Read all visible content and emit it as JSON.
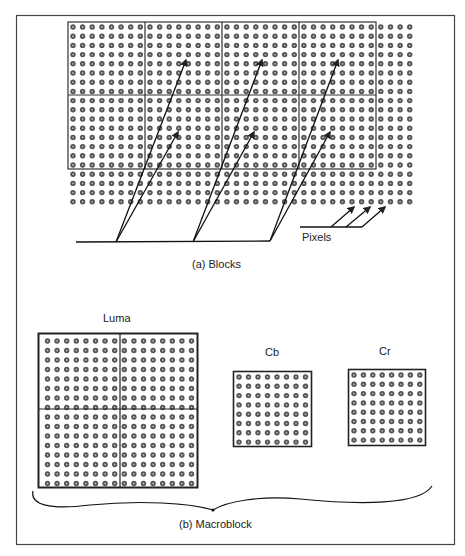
{
  "figure": {
    "part_a": {
      "caption": "(a) Blocks",
      "pixels_label": "Pixels",
      "block_grid": {
        "block_cols": 4,
        "block_rows": 2,
        "pixels_per_block": 8,
        "extra_cols": 4,
        "extra_rows": 4
      }
    },
    "part_b": {
      "caption": "(b) Macroblock",
      "luma_label": "Luma",
      "cb_label": "Cb",
      "cr_label": "Cr",
      "luma_grid": 16,
      "chroma_grid": 8
    },
    "colors": {
      "ink": "#2a2a2a",
      "dot_fill": "#555555",
      "dot_center": "#bbbbbb",
      "background": "#ffffff"
    }
  }
}
